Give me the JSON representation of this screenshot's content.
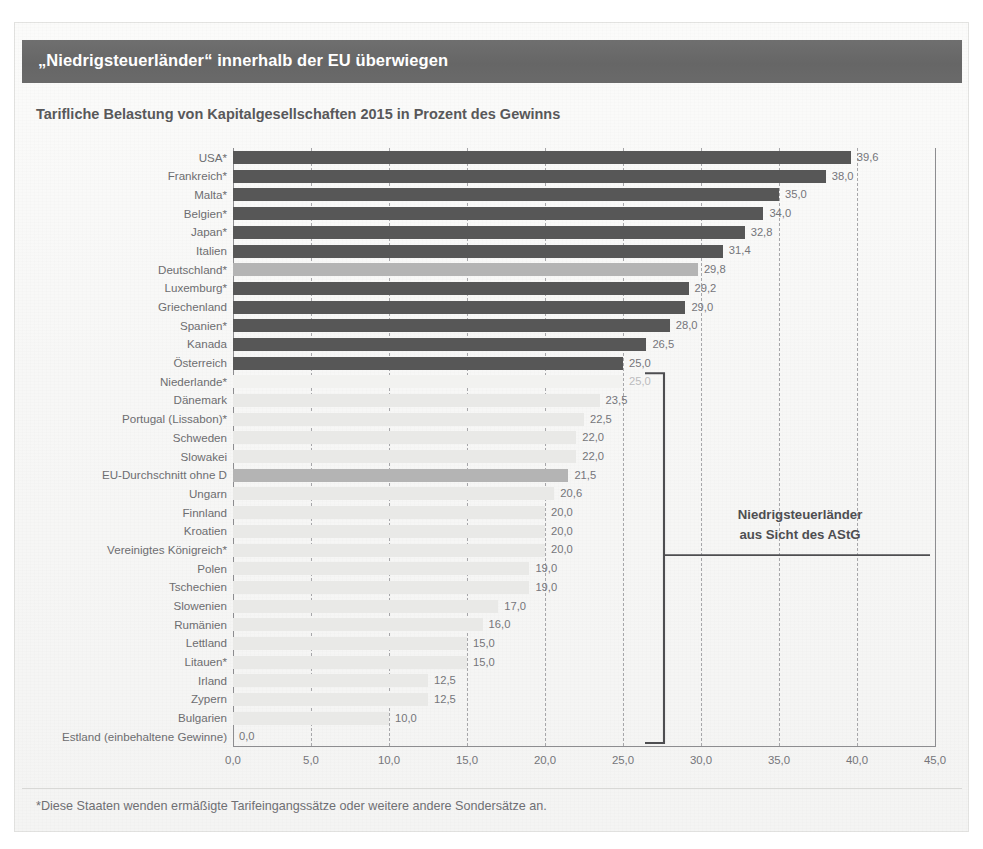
{
  "header": {
    "title": "„Niedrigsteuerländer“ innerhalb der EU überwiegen",
    "band_color": "#6b6b6b",
    "title_color": "#ffffff"
  },
  "subtitle": "Tarifliche Belastung von Kapitalgesellschaften 2015 in Prozent des Gewinns",
  "annotation": {
    "line1": "Niedrigsteuerländer",
    "line2": "aus Sicht des AStG"
  },
  "footnote": "*Diese Staaten wenden ermäßigte Tarifeingangssätze oder weitere andere Sondersätze an.",
  "colors": {
    "bar_dark": "#575757",
    "bar_highlight": "#b4b4b4",
    "bar_light": "#e9e9e7",
    "bar_faint": "#f2f2f0",
    "axis": "#8d8d90",
    "grid": "#a7a7aa",
    "text": "#6d6d70",
    "bracket": "#4e4e51"
  },
  "chart_data": {
    "type": "bar",
    "orientation": "horizontal",
    "title": "„Niedrigsteuerländer“ innerhalb der EU überwiegen",
    "subtitle": "Tarifliche Belastung von Kapitalgesellschaften 2015 in Prozent des Gewinns",
    "xlabel": "",
    "ylabel": "",
    "xlim": [
      0,
      45
    ],
    "xticks": [
      0,
      5,
      10,
      15,
      20,
      25,
      30,
      35,
      40,
      45
    ],
    "xtick_labels": [
      "0,0",
      "5,0",
      "10,0",
      "15,0",
      "20,0",
      "25,0",
      "30,0",
      "35,0",
      "40,0",
      "45,0"
    ],
    "grid": true,
    "legend": false,
    "value_format": "comma-decimal",
    "categories": [
      "USA*",
      "Frankreich*",
      "Malta*",
      "Belgien*",
      "Japan*",
      "Italien",
      "Deutschland*",
      "Luxemburg*",
      "Griechenland",
      "Spanien*",
      "Kanada",
      "Österreich",
      "Niederlande*",
      "Dänemark",
      "Portugal (Lissabon)*",
      "Schweden",
      "Slowakei",
      "EU-Durchschnitt ohne D",
      "Ungarn",
      "Finnland",
      "Kroatien",
      "Vereinigtes Königreich*",
      "Polen",
      "Tschechien",
      "Slowenien",
      "Rumänien",
      "Lettland",
      "Litauen*",
      "Irland",
      "Zypern",
      "Bulgarien",
      "Estland (einbehaltene Gewinne)"
    ],
    "values": [
      39.6,
      38.0,
      35.0,
      34.0,
      32.8,
      31.4,
      29.8,
      29.2,
      29.0,
      28.0,
      26.5,
      25.0,
      25.0,
      23.5,
      22.5,
      22.0,
      22.0,
      21.5,
      20.6,
      20.0,
      20.0,
      20.0,
      19.0,
      19.0,
      17.0,
      16.0,
      15.0,
      15.0,
      12.5,
      12.5,
      10.0,
      0.0
    ],
    "value_labels": [
      "39,6",
      "38,0",
      "35,0",
      "34,0",
      "32,8",
      "31,4",
      "29,8",
      "29,2",
      "29,0",
      "28,0",
      "26,5",
      "25,0",
      "25,0",
      "23,5",
      "22,5",
      "22,0",
      "22,0",
      "21,5",
      "20,6",
      "20,0",
      "20,0",
      "20,0",
      "19,0",
      "19,0",
      "17,0",
      "16,0",
      "15,0",
      "15,0",
      "12,5",
      "12,5",
      "10,0",
      "0,0"
    ],
    "bar_styles": [
      "dark",
      "dark",
      "dark",
      "dark",
      "dark",
      "dark",
      "highlight",
      "dark",
      "dark",
      "dark",
      "dark",
      "dark",
      "faint",
      "light",
      "light",
      "light",
      "light",
      "highlight",
      "light",
      "light",
      "light",
      "light",
      "light",
      "light",
      "light",
      "light",
      "light",
      "light",
      "light",
      "light",
      "light",
      "light"
    ],
    "annotations": [
      {
        "text": "Niedrigsteuerländer aus Sicht des AStG",
        "bracket_from_category": "Niederlande*",
        "bracket_to_category": "Estland (einbehaltene Gewinne)"
      }
    ]
  }
}
